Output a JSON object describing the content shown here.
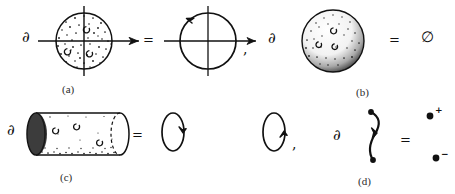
{
  "figure": {
    "title": "",
    "background_color": "#ffffff",
    "ink_color": "#111111",
    "width": 455,
    "height": 194
  },
  "symbols": {
    "partial": "∂",
    "equals": "=",
    "comma": ",",
    "emptyset": "∅",
    "plus": "+",
    "minus": "−"
  },
  "panels": [
    {
      "id": "a",
      "caption": "(a)",
      "lhs": {
        "operator": "∂",
        "shape": "filled-stippled-disk-with-axes",
        "description": "stippled disk of radius ~28px with horizontal and vertical axes and rightward arrow on horizontal axis"
      },
      "relation": "=",
      "rhs": {
        "shape": "circle-with-counterclockwise-arrow-and-axes",
        "description": "unfilled circle with counterclockwise orientation arrow at upper left, axes, rightward arrow on horizontal axis"
      },
      "trailing_punctuation": ","
    },
    {
      "id": "b",
      "caption": "(b)",
      "lhs": {
        "operator": "∂",
        "shape": "shaded-solid-ball",
        "description": "stipple-shaded solid sphere, darker along lower-left limb, small circular surface marks"
      },
      "relation": "=",
      "rhs": {
        "shape": "empty-set",
        "value": "∅"
      },
      "trailing_punctuation": ""
    },
    {
      "id": "c",
      "caption": "(c)",
      "lhs": {
        "operator": "∂",
        "shape": "solid-cylinder",
        "description": "horizontal cylinder, shaded elliptical left cap, dashed hidden right cap, stippled lower wall"
      },
      "relation": "=",
      "rhs": {
        "shape": "two-oriented-circles",
        "description": "vertical ellipse with downward arrow, then vertical ellipse with upward arrow",
        "items": [
          {
            "orientation": "down"
          },
          {
            "orientation": "up"
          }
        ]
      },
      "trailing_punctuation": ","
    },
    {
      "id": "d",
      "caption": "(d)",
      "lhs": {
        "operator": "∂",
        "shape": "oriented-arc-with-endpoints",
        "description": "S-shaped arc with filled dots at both ends and upward arrowhead at midpoint"
      },
      "relation": "=",
      "rhs": {
        "shape": "two-signed-points",
        "points": [
          {
            "sign": "+",
            "position": "upper"
          },
          {
            "sign": "−",
            "position": "lower"
          }
        ]
      },
      "trailing_punctuation": ""
    }
  ]
}
